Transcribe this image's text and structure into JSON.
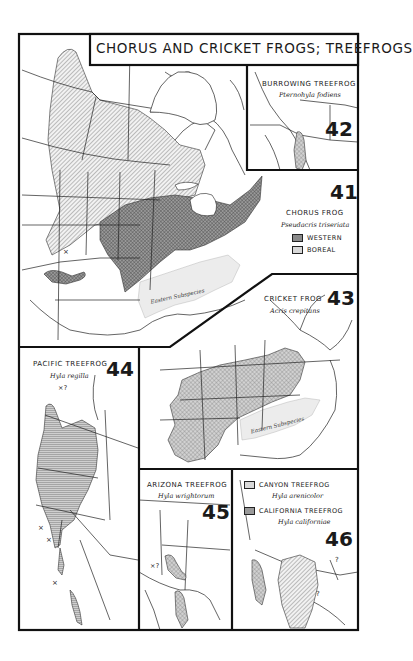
{
  "title": "CHORUS AND CRICKET FROGS; TREEFROGS",
  "colors": {
    "ink": "#1a1a1a",
    "paper": "#ffffff",
    "western_fill": "#8a8a8a",
    "boreal_fill": "#c8c8c8",
    "eastern_subspecies_fill": "#ececec",
    "cricket_fill": "#b4b4b4",
    "pacific_fill": "#9a9a9a",
    "canyon_fill": "#cfcfcf",
    "california_fill": "#9a9a9a"
  },
  "maps": [
    {
      "number": "42",
      "common_name": "BURROWING TREEFROG",
      "scientific_name": "Pternohyla fodiens"
    },
    {
      "number": "41",
      "common_name": "CHORUS FROG",
      "scientific_name": "Pseudacris triseriata",
      "legend": [
        {
          "pattern": "cross-hatch",
          "label": "WESTERN"
        },
        {
          "pattern": "diagonal-hatch",
          "label": "BOREAL"
        }
      ],
      "annotation": "Eastern Subspecies",
      "markers": [
        "×"
      ]
    },
    {
      "number": "43",
      "common_name": "CRICKET FROG",
      "scientific_name": "Acris crepitans",
      "annotation": "Eastern Subspecies"
    },
    {
      "number": "44",
      "common_name": "PACIFIC TREEFROG",
      "scientific_name": "Hyla regilla",
      "markers": [
        "×?",
        "×",
        "×",
        "×"
      ]
    },
    {
      "number": "45",
      "common_name": "ARIZONA TREEFROG",
      "scientific_name": "Hyla wrightorum",
      "markers": [
        "×?"
      ]
    },
    {
      "number": "46",
      "legend": [
        {
          "pattern": "diagonal-hatch",
          "label": "CANYON TREEFROG",
          "scientific_name": "Hyla arenicolor"
        },
        {
          "pattern": "dot-stipple",
          "label": "CALIFORNIA TREEFROG",
          "scientific_name": "Hyla californiae"
        }
      ],
      "markers": [
        "?",
        "?"
      ]
    }
  ]
}
